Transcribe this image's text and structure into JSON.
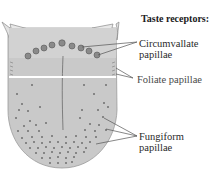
{
  "title": "Taste receptors:",
  "labels": {
    "circumvallate": {
      "line1": "Circumvallate",
      "line2": "papillae"
    },
    "foliate": {
      "line1": "Foliate papillae"
    },
    "fungiform": {
      "line1": "Fungiform",
      "line2": "papillae"
    }
  },
  "colors": {
    "tongue_fill": "#c9c9c9",
    "tongue_outline": "#8a8a8a",
    "papilla": "#6e6e6e",
    "white_band": "#ffffff",
    "leader_line": "#555555",
    "text": "#2a2a2a"
  }
}
